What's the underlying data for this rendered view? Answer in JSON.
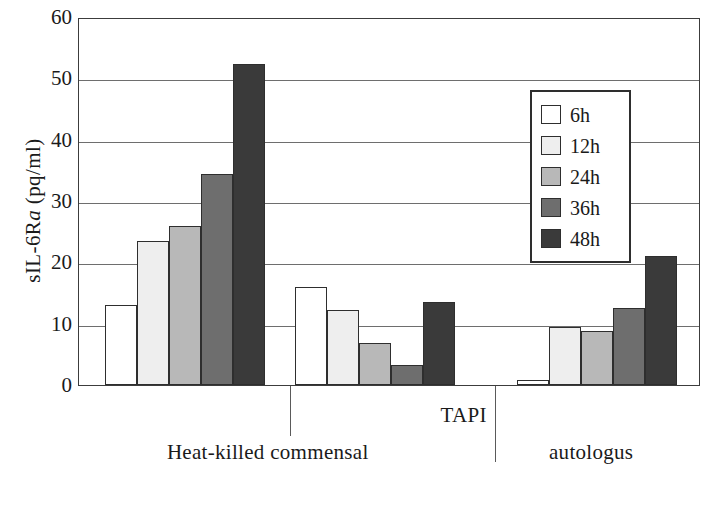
{
  "chart_data": {
    "type": "bar",
    "title": "",
    "xlabel": "",
    "ylabel": "sIL-6Ra (pq/ml)",
    "ylabel_parts": {
      "pre": "sIL-6R",
      "italic": "a",
      "post": " (pq/ml)"
    },
    "ylim": [
      0,
      60
    ],
    "yticks": [
      0,
      10,
      20,
      30,
      40,
      50,
      60
    ],
    "ytick_labels": [
      "0",
      "10",
      "20",
      "30",
      "40",
      "50",
      "60"
    ],
    "grid": true,
    "grid_axis": "y",
    "legend_position": "upper right",
    "legend_title": "",
    "series": [
      {
        "name": "6h",
        "color": "#ffffff",
        "values": [
          13.0,
          16.0,
          0.8
        ]
      },
      {
        "name": "12h",
        "color": "#eeeeee",
        "values": [
          23.5,
          12.3,
          9.4
        ]
      },
      {
        "name": "24h",
        "color": "#b8b8b8",
        "values": [
          26.0,
          6.9,
          8.8
        ]
      },
      {
        "name": "36h",
        "color": "#6e6e6e",
        "values": [
          34.4,
          3.2,
          12.5
        ]
      },
      {
        "name": "48h",
        "color": "#3a3a3a",
        "values": [
          52.3,
          13.6,
          21.0
        ]
      }
    ],
    "categories": [
      "Heat-killed commensal",
      "TAPI",
      "autologus"
    ],
    "group_labels": [
      {
        "text": "Heat-killed commensal",
        "level": "lower",
        "center_pct": 30.5
      },
      {
        "text": "TAPI",
        "level": "upper",
        "center_pct": 62.0
      },
      {
        "text": "autologus",
        "level": "lower",
        "center_pct": 82.5
      }
    ],
    "annotations": []
  },
  "axis": {
    "frame_color": "#3c3c3c",
    "grid_color": "#6e6e6e"
  }
}
